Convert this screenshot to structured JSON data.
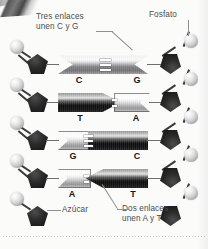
{
  "figure": {
    "language": "es"
  },
  "annotations": [
    {
      "id": "bonds-cg",
      "text": "Tres enlaces\nunen C y G",
      "x": 36,
      "y": 12
    },
    {
      "id": "phosphate",
      "text": "Fosfato",
      "x": 149,
      "y": 10
    },
    {
      "id": "sugar",
      "text": "Azúcar",
      "x": 62,
      "y": 205
    },
    {
      "id": "bonds-at",
      "text": "Dos enlaces\nunen A y T",
      "x": 122,
      "y": 204
    }
  ],
  "base_pairs": [
    {
      "left": "C",
      "right": "G",
      "bond_count": 3,
      "left_shade": "mid",
      "right_shade": "mid",
      "y": 55
    },
    {
      "left": "T",
      "right": "A",
      "bond_count": 2,
      "left_shade": "dark",
      "right_shade": "light",
      "y": 93
    },
    {
      "left": "G",
      "right": "C",
      "bond_count": 3,
      "left_shade": "light",
      "right_shade": "dark",
      "y": 131
    },
    {
      "left": "A",
      "right": "T",
      "bond_count": 2,
      "left_shade": "light",
      "right_shade": "dark",
      "y": 169
    }
  ],
  "backbone": {
    "left_label": "cadena de azúcar-fosfato izquierda",
    "right_label": "cadena de azúcar-fosfato derecha",
    "phosphate_icon": "sphere-icon",
    "sugar_icon": "pentagon-icon",
    "phosphate_count": 9,
    "sugar_count": 9
  },
  "colors": {
    "background": "#fbfbfa",
    "text": "#4b4b50",
    "letter": "#16161a",
    "phosphate": "#d4d4d7",
    "sugar": "#141414",
    "leader": "#8e8e94"
  }
}
